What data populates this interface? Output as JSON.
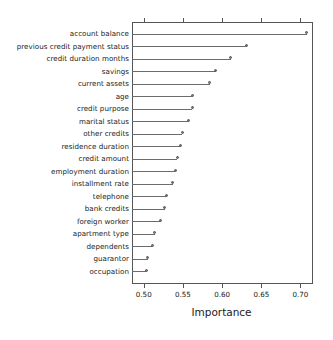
{
  "chart_data": {
    "type": "bar",
    "subtype": "dotchart",
    "title": "",
    "xlabel": "Importance",
    "ylabel": "",
    "xlim": [
      0.485,
      0.716
    ],
    "ylim": [
      0,
      21
    ],
    "grid": false,
    "legend": null,
    "xticks": [
      0.5,
      0.55,
      0.6,
      0.65,
      0.7
    ],
    "xticklabels": [
      "0.50",
      "0.55",
      "0.60",
      "0.65",
      "0.70"
    ],
    "baseline": 0.485,
    "categories": [
      "account balance",
      "previous credit payment status",
      "credit duration months",
      "savings",
      "current assets",
      "age",
      "credit purpose",
      "marital status",
      "other credits",
      "residence duration",
      "credit amount",
      "employment duration",
      "installment rate",
      "telephone",
      "bank credits",
      "foreign worker",
      "apartment type",
      "dependents",
      "guarantor",
      "occupation"
    ],
    "values": [
      0.708,
      0.631,
      0.611,
      0.592,
      0.584,
      0.562,
      0.562,
      0.557,
      0.549,
      0.547,
      0.543,
      0.54,
      0.537,
      0.529,
      0.527,
      0.521,
      0.514,
      0.511,
      0.505,
      0.503
    ]
  },
  "axis": {
    "x_title": "Importance"
  },
  "colors": {
    "line": "#6b6b6b",
    "point": "#777777",
    "frame": "#555555",
    "text": "#1a1a1a",
    "background": "#ffffff"
  }
}
